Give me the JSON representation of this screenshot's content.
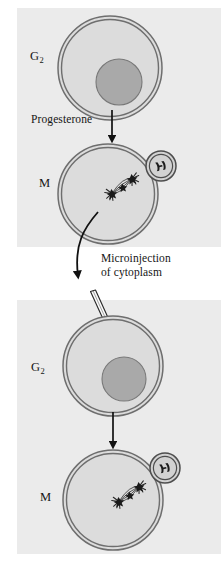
{
  "figure": {
    "background_color": "#ffffff",
    "panel_color": "#ebebeb",
    "ink_color": "#1b1b1b",
    "membrane_color": "#6b6b6b",
    "cytoplasm_color": "#d9d9d9",
    "nucleus_color": "#a8a8a8"
  },
  "panels": [
    {
      "id": "top",
      "x": 17,
      "y": 8,
      "width": 204,
      "height": 239
    },
    {
      "id": "bottom",
      "x": 17,
      "y": 300,
      "width": 204,
      "height": 254
    }
  ],
  "labels": {
    "g2_top": {
      "text": "G",
      "subscript": "2"
    },
    "m_top": {
      "text": "M"
    },
    "progesterone": {
      "text": "Progesterone"
    },
    "microinjection_line1": {
      "text": "Microinjection"
    },
    "microinjection_line2": {
      "text": "of cytoplasm"
    },
    "g2_bottom": {
      "text": "G",
      "subscript": "2"
    },
    "m_bottom": {
      "text": "M"
    }
  },
  "cells": [
    {
      "name": "g2-cell-top",
      "phase_label": "G2",
      "cx": 110,
      "cy": 68,
      "r": 52,
      "nucleus": {
        "cx": 119,
        "cy": 82,
        "r": 23
      },
      "has_spindle": false,
      "has_chromosome_inset": false,
      "injected": false
    },
    {
      "name": "m-cell-top",
      "phase_label": "M",
      "cx": 108,
      "cy": 194,
      "r": 50,
      "nucleus": null,
      "has_spindle": true,
      "spindle": {
        "cx": 122,
        "cy": 186
      },
      "has_chromosome_inset": true,
      "inset": {
        "cx": 161,
        "cy": 166,
        "r": 15
      },
      "injected": false
    },
    {
      "name": "g2-cell-bottom",
      "phase_label": "G2",
      "cx": 113,
      "cy": 366,
      "r": 50,
      "nucleus": {
        "cx": 124,
        "cy": 379,
        "r": 22
      },
      "has_spindle": false,
      "has_chromosome_inset": false,
      "injected": true
    },
    {
      "name": "m-cell-bottom",
      "phase_label": "M",
      "cx": 113,
      "cy": 500,
      "r": 50,
      "nucleus": null,
      "has_spindle": true,
      "spindle": {
        "cx": 129,
        "cy": 494
      },
      "has_chromosome_inset": true,
      "inset": {
        "cx": 165,
        "cy": 468,
        "r": 15
      },
      "injected": false
    }
  ],
  "arrows": [
    {
      "name": "progesterone-arrow",
      "type": "straight",
      "x": 112,
      "y1": 112,
      "y2": 141,
      "label": "Progesterone"
    },
    {
      "name": "microinjection-arrow",
      "type": "curved",
      "label": "Microinjection of cytoplasm"
    },
    {
      "name": "induction-arrow",
      "type": "straight",
      "x": 113,
      "y1": 413,
      "y2": 446,
      "label": ""
    }
  ],
  "micropipette": {
    "name": "micropipette",
    "tip_x": 119,
    "tip_y": 348,
    "tail_x": 96,
    "tail_y": 293,
    "description": "needle penetrating the G2 cell membrane"
  },
  "icons": {
    "spindle": "mitotic-spindle-icon",
    "chromosome_inset": "condensed-chromosomes-icon",
    "pipette": "micropipette-icon"
  }
}
